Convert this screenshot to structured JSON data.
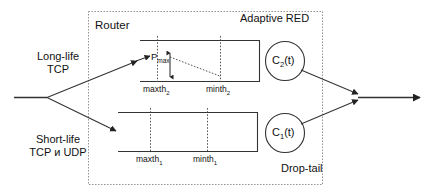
{
  "diagram": {
    "router_label": "Router",
    "adaptive_red_label": "Adaptive  RED",
    "drop_tail_label": "Drop-tail",
    "inputs": [
      {
        "name": "long-life",
        "line1": "Long-life",
        "line2": "TCP"
      },
      {
        "name": "short-life",
        "line1": "Short-life",
        "line2": "TCP и UDP"
      }
    ],
    "queues": [
      {
        "name": "adaptive-red-queue",
        "capacity_label": "C",
        "capacity_sub": "2",
        "capacity_suffix": "(t)",
        "maxth_label": "maxth",
        "maxth_sub": "2",
        "minth_label": "minth",
        "minth_sub": "2",
        "pmax_label": "P",
        "pmax_sub": "max"
      },
      {
        "name": "drop-tail-queue",
        "capacity_label": "C",
        "capacity_sub": "1",
        "capacity_suffix": "(t)",
        "maxth_label": "maxth",
        "maxth_sub": "1",
        "minth_label": "minth",
        "minth_sub": "1"
      }
    ],
    "colors": {
      "stroke": "#333333",
      "dotted_border": "#7a7a7a",
      "text": "#111111",
      "background": "#ffffff"
    }
  }
}
